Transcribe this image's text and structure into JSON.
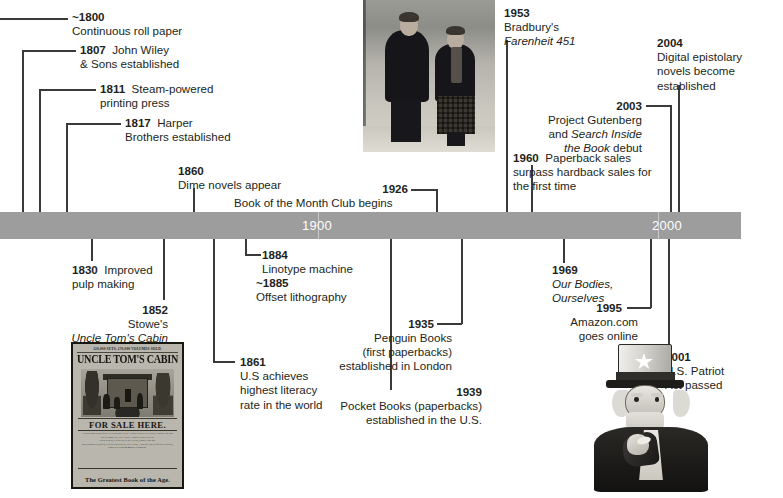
{
  "timeline": {
    "bar_color": "#9d9d9d",
    "markers": [
      {
        "label": "1900"
      },
      {
        "label": "2000"
      }
    ]
  },
  "events": [
    {
      "id": "e1800",
      "year": "~1800",
      "lines": [
        "Continuous  roll paper"
      ]
    },
    {
      "id": "e1807",
      "year": "1807",
      "lines": [
        "John Wiley",
        "& Sons established"
      ]
    },
    {
      "id": "e1811",
      "year": "1811",
      "lines": [
        "Steam-powered",
        "printing press"
      ]
    },
    {
      "id": "e1817",
      "year": "1817",
      "lines": [
        "Harper",
        "Brothers established"
      ]
    },
    {
      "id": "e1830",
      "year": "1830",
      "lines": [
        "Improved",
        "pulp making"
      ]
    },
    {
      "id": "e1852",
      "year": "1852",
      "lines": [
        "Stowe's",
        "Uncle Tom's Cabin"
      ]
    },
    {
      "id": "e1860",
      "year": "1860",
      "lines": [
        "Dime novels appear"
      ]
    },
    {
      "id": "e1861",
      "year": "1861",
      "lines": [
        "U.S achieves",
        "highest literacy",
        "rate in the world"
      ]
    },
    {
      "id": "e1884",
      "year": "1884",
      "lines": [
        "Linotype machine"
      ]
    },
    {
      "id": "e1885",
      "year": "~1885",
      "lines": [
        "Offset lithography"
      ]
    },
    {
      "id": "e1926",
      "year": "1926",
      "lines": [
        "Book of the  Month Club begins"
      ]
    },
    {
      "id": "e1935",
      "year": "1935",
      "lines": [
        "Penguin Books",
        "(first paperbacks)",
        "established in London"
      ]
    },
    {
      "id": "e1939",
      "year": "1939",
      "lines": [
        "Pocket Books (paperbacks)",
        "established in the U.S."
      ]
    },
    {
      "id": "e1953",
      "year": "1953",
      "lines": [
        "Bradbury's",
        "Farenheit 451"
      ]
    },
    {
      "id": "e1960",
      "year": "1960",
      "lines": [
        "Paperback sales",
        "surpass hardback sales for",
        "the first time"
      ]
    },
    {
      "id": "e1969",
      "year": "1969",
      "lines": [
        "Our Bodies,",
        "Ourselves"
      ]
    },
    {
      "id": "e1995",
      "year": "1995",
      "lines": [
        "Amazon.com",
        "goes online"
      ]
    },
    {
      "id": "e2001",
      "year": "2001",
      "lines": [
        "U.S. Patriot",
        "Act passed"
      ]
    },
    {
      "id": "e2003",
      "year": "2003",
      "lines": [
        "Project Gutenberg",
        "and Search Inside",
        "the Book debut"
      ]
    },
    {
      "id": "e2004",
      "year": "2004",
      "lines": [
        "Digital epistolary",
        "novels become",
        "established"
      ]
    }
  ],
  "event_text": {
    "e1800": {
      "year": "~1800",
      "l1": "Continuous  roll paper"
    },
    "e1807": {
      "year": "1807",
      "l1": "John Wiley",
      "l2": "& Sons established"
    },
    "e1811": {
      "year": "1811",
      "l1": "Steam-powered",
      "l2": "printing press"
    },
    "e1817": {
      "year": "1817",
      "l1": "Harper",
      "l2": "Brothers established"
    },
    "e1830": {
      "year": "1830",
      "l1": "Improved",
      "l2": "pulp making"
    },
    "e1852": {
      "year": "1852",
      "l1": "Stowe's",
      "l2": "Uncle Tom's Cabin"
    },
    "e1860": {
      "year": "1860",
      "l1": "Dime novels appear"
    },
    "e1861": {
      "year": "1861",
      "l1": "U.S achieves",
      "l2": "highest literacy",
      "l3": "rate in the world"
    },
    "e1884": {
      "year": "1884",
      "l1": "Linotype machine"
    },
    "e1885": {
      "year": "~1885",
      "l1": "Offset lithography"
    },
    "e1926": {
      "year": "1926",
      "l1": "Book of the  Month Club begins"
    },
    "e1935": {
      "year": "1935",
      "l1": "Penguin Books",
      "l2": "(first paperbacks)",
      "l3": "established in London"
    },
    "e1939": {
      "year": "1939",
      "l1": "Pocket Books (paperbacks)",
      "l2": "established in the U.S."
    },
    "e1953": {
      "year": "1953",
      "l1": "Bradbury's",
      "l2": "Farenheit 451"
    },
    "e1960": {
      "year": "1960",
      "l1": "Paperback sales",
      "l2": "surpass hardback sales for",
      "l3": "the first time"
    },
    "e1969": {
      "year": "1969",
      "l1": "Our Bodies,",
      "l2": "Ourselves"
    },
    "e1995": {
      "year": "1995",
      "l1": "Amazon.com",
      "l2": "goes online"
    },
    "e2001": {
      "year": "2001",
      "l1": "U.S. Patriot",
      "l2": "Act passed"
    },
    "e2003": {
      "year": "2003",
      "l1": "Project Gutenberg",
      "l2a": "and ",
      "l2i": "Search Inside",
      "l3i": "the Book",
      "l3a": " debut"
    },
    "e2004": {
      "year": "2004",
      "l1": "Digital epistolary",
      "l2": "novels become",
      "l3": "established"
    }
  },
  "images": {
    "bradbury_photo": {
      "name": "two-young-people-winter-photograph"
    },
    "uncle_toms_cabin_poster": {
      "name": "uncle-toms-cabin-broadside-poster",
      "top_line": "120,000 SETS, 270,000 VOLUMES SOLD.",
      "title": "UNCLE TOM'S CABIN",
      "for_sale": "FOR SALE HERE.",
      "body_1": "A SUPERB EDITION. ILLUSTRATED. TWO VOLS. CLOTH. PRICE $1.50.",
      "body_2": "IN GERMAN, IN 1 VOL. PRICE 50 CENTS.",
      "body_3": "IN 2 VOLS, CLOTH, 6 PLATES, PRICE $1.50.",
      "body_4": "SUPERB ILLUSTRATED EDITION, IN 1 VOL., WITH 153 ENGRAVINGS,",
      "body_5": "PRICES FROM $2.50 TO $5.00.",
      "bottom": "The Greatest Book of the Age."
    },
    "uncle_sam": {
      "name": "uncle-sam-pointing-illustration"
    }
  }
}
